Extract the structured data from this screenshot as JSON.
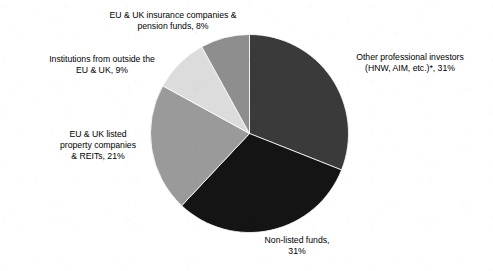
{
  "chart_data": {
    "type": "pie",
    "title": "",
    "subtitle": "",
    "xlabel": "",
    "ylabel": "",
    "legend_position": "outside-labels",
    "grid": false,
    "start_angle_deg": 0,
    "direction": "clockwise",
    "categories": [
      "Other professional investors (HNW, AIM, etc.)*",
      "Non-listed funds",
      "EU & UK listed property companies & REITs",
      "Institutions from outside the EU & UK",
      "EU & UK insurance companies & pension funds"
    ],
    "values": [
      31,
      31,
      21,
      9,
      8
    ],
    "units": "%",
    "slices": [
      {
        "key": "other-professional-investors",
        "value": 31,
        "value_text": "31%",
        "color": "#3a3a3a",
        "label_lines": [
          "Other professional investors",
          "(HNW, AIM, etc.)*, 31%"
        ]
      },
      {
        "key": "non-listed-funds",
        "value": 31,
        "value_text": "31%",
        "color": "#141414",
        "label_lines": [
          "Non-listed funds,",
          "31%"
        ]
      },
      {
        "key": "eu-uk-listed-property-companies-reits",
        "value": 21,
        "value_text": "21%",
        "color": "#9a9a9a",
        "label_lines": [
          "EU & UK listed",
          "property companies",
          "& REITs, 21%"
        ]
      },
      {
        "key": "institutions-outside-eu-uk",
        "value": 9,
        "value_text": "9%",
        "color": "#dcdcdc",
        "label_lines": [
          "Institutions from outside the",
          "EU & UK, 9%"
        ]
      },
      {
        "key": "eu-uk-insurance-pension-funds",
        "value": 8,
        "value_text": "8%",
        "color": "#8e8e8e",
        "label_lines": [
          "EU & UK insurance companies &",
          "pension funds, 8%"
        ]
      }
    ]
  },
  "labels": {
    "insurance": {
      "line1": "EU & UK insurance companies &",
      "line2": "pension funds, 8%"
    },
    "outside": {
      "line1": "Institutions from outside the",
      "line2": "EU & UK, 9%"
    },
    "reits": {
      "line1": "EU & UK listed",
      "line2": "property companies",
      "line3": "& REITs, 21%"
    },
    "other_professional": {
      "line1": "Other professional investors",
      "line2": "(HNW, AIM, etc.)*, 31%"
    },
    "nonlisted": {
      "line1": "Non-listed funds,",
      "line2": "31%"
    }
  }
}
